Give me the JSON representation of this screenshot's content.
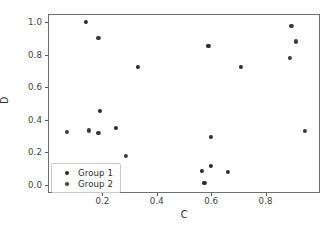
{
  "chart_data": {
    "type": "scatter",
    "title": "",
    "xlabel": "C",
    "ylabel": "D",
    "xlim": [
      0.0,
      1.0
    ],
    "ylim": [
      -0.05,
      1.05
    ],
    "grid": false,
    "legend_position": "lower left",
    "xticks": [
      "0.2",
      "0.4",
      "0.6",
      "0.8"
    ],
    "xtick_values": [
      0.2,
      0.4,
      0.6,
      0.8
    ],
    "yticks": [
      "0.0",
      "0.2",
      "0.4",
      "0.6",
      "0.8",
      "1.0"
    ],
    "ytick_values": [
      0.0,
      0.2,
      0.4,
      0.6,
      0.8,
      1.0
    ],
    "series": [
      {
        "name": "Group 1",
        "color": "#2b2b2b",
        "marker": "circle",
        "points": [
          {
            "x": 0.14,
            "y": 1.0
          },
          {
            "x": 0.19,
            "y": 0.455
          },
          {
            "x": 0.25,
            "y": 0.35
          },
          {
            "x": 0.33,
            "y": 0.723
          },
          {
            "x": 0.565,
            "y": 0.088
          },
          {
            "x": 0.575,
            "y": 0.012
          },
          {
            "x": 0.59,
            "y": 0.855
          },
          {
            "x": 0.6,
            "y": 0.295
          },
          {
            "x": 0.6,
            "y": 0.117
          },
          {
            "x": 0.66,
            "y": 0.079
          },
          {
            "x": 0.71,
            "y": 0.723
          }
        ]
      },
      {
        "name": "Group 2",
        "color": "#3a3a3a",
        "marker": "circle",
        "points": [
          {
            "x": 0.07,
            "y": 0.325
          },
          {
            "x": 0.15,
            "y": 0.335
          },
          {
            "x": 0.185,
            "y": 0.905
          },
          {
            "x": 0.185,
            "y": 0.32
          },
          {
            "x": 0.285,
            "y": 0.178
          },
          {
            "x": 0.89,
            "y": 0.78
          },
          {
            "x": 0.895,
            "y": 0.977
          },
          {
            "x": 0.91,
            "y": 0.882
          },
          {
            "x": 0.945,
            "y": 0.33
          }
        ]
      }
    ]
  },
  "legend": {
    "entries": [
      {
        "label": "Group 1"
      },
      {
        "label": "Group 2"
      }
    ]
  }
}
